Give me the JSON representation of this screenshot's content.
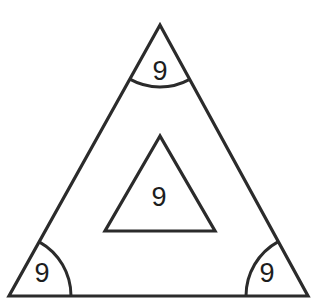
{
  "figure": {
    "background_color": "#ffffff",
    "stroke_color": "#2b2b2b",
    "label_color": "#1d1d1d"
  },
  "chart_data": {
    "type": "diagram",
    "title": "",
    "shapes": [
      {
        "name": "outer-triangle",
        "kind": "triangle",
        "vertices": [
          [
            160,
            25
          ],
          [
            9,
            296
          ],
          [
            308,
            296
          ]
        ]
      },
      {
        "name": "inner-triangle",
        "kind": "triangle",
        "vertices": [
          [
            160,
            136
          ],
          [
            105,
            231
          ],
          [
            215,
            231
          ]
        ]
      }
    ],
    "angle_arcs": [
      {
        "name": "apex-arc",
        "vertex": [
          160,
          25
        ],
        "radius": 62
      },
      {
        "name": "bottom-left-arc",
        "vertex": [
          9,
          296
        ],
        "radius": 62
      },
      {
        "name": "bottom-right-arc",
        "vertex": [
          308,
          296
        ],
        "radius": 62
      }
    ],
    "labels": [
      {
        "name": "apex-angle-label",
        "text": "9",
        "x": 160,
        "y": 73
      },
      {
        "name": "inner-triangle-label",
        "text": "9",
        "x": 159,
        "y": 199
      },
      {
        "name": "bottom-left-angle-label",
        "text": "9",
        "x": 42,
        "y": 275
      },
      {
        "name": "bottom-right-angle-label",
        "text": "9",
        "x": 267,
        "y": 275
      }
    ]
  },
  "labels": {
    "apex": "9",
    "inner": "9",
    "bottom_left": "9",
    "bottom_right": "9"
  }
}
